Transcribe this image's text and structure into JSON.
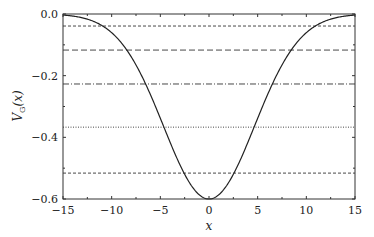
{
  "chart_data": {
    "type": "line",
    "title": "",
    "xlabel": "x",
    "ylabel": "V_G(x)",
    "xlim": [
      -15,
      15
    ],
    "ylim": [
      -0.6,
      0.0
    ],
    "grid": false,
    "legend": null,
    "x_ticks": [
      -15,
      -10,
      -5,
      0,
      5,
      10,
      15
    ],
    "x_tick_labels": [
      "−15",
      "−10",
      "−5",
      "0",
      "5",
      "10",
      "15"
    ],
    "y_ticks": [
      0.0,
      -0.2,
      -0.4,
      -0.6
    ],
    "y_tick_labels": [
      "0.0",
      "−0.2",
      "−0.4",
      "−0.6"
    ],
    "series": [
      {
        "name": "V_G(x) Gaussian potential",
        "style": "solid",
        "function": "-0.6*exp(-x^2/(2*4.67^2))",
        "x": [
          -15,
          -12.5,
          -10,
          -7.5,
          -5,
          -2.5,
          0,
          2.5,
          5,
          7.5,
          10,
          12.5,
          15
        ],
        "y": [
          -0.0034,
          -0.017,
          -0.061,
          -0.165,
          -0.339,
          -0.519,
          -0.6,
          -0.519,
          -0.339,
          -0.165,
          -0.061,
          -0.017,
          -0.0034
        ]
      }
    ],
    "horizontal_lines": [
      {
        "y": -0.039,
        "style": "dashed-fine"
      },
      {
        "y": -0.117,
        "style": "dashed"
      },
      {
        "y": -0.227,
        "style": "dash-dot"
      },
      {
        "y": -0.367,
        "style": "dotted"
      },
      {
        "y": -0.516,
        "style": "dashed-fine"
      }
    ]
  },
  "labels": {
    "xlabel": "x",
    "ylabel_main": "V",
    "ylabel_sub": "G",
    "ylabel_arg": "(x)"
  }
}
